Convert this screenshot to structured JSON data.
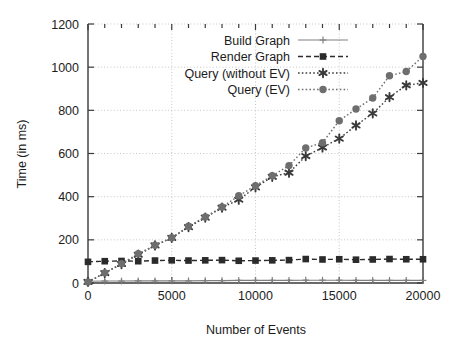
{
  "chart_data": {
    "type": "line",
    "title": "",
    "subtitle": "",
    "xlabel": "Number of Events",
    "ylabel": "Time (in ms)",
    "xlim": [
      0,
      20000
    ],
    "ylim": [
      0,
      1200
    ],
    "xticks": [
      0,
      5000,
      10000,
      15000,
      20000
    ],
    "xtick_labels": [
      "0",
      "5000",
      "10000",
      "15000",
      "20000"
    ],
    "yticks": [
      0,
      200,
      400,
      600,
      800,
      1000,
      1200
    ],
    "ytick_labels": [
      "0",
      "200",
      "400",
      "600",
      "800",
      "1000",
      "1200"
    ],
    "x_minor_tick_step": 1000,
    "grid": true,
    "grid_style": "dotted",
    "legend_position": "top-center",
    "legend_box": false,
    "x": [
      0,
      1000,
      2000,
      3000,
      4000,
      5000,
      6000,
      7000,
      8000,
      9000,
      10000,
      11000,
      12000,
      13000,
      14000,
      15000,
      16000,
      17000,
      18000,
      19000,
      20000
    ],
    "series": [
      {
        "name": "Build Graph",
        "marker": "plus",
        "line": "solid",
        "color": "#808080",
        "values": [
          8,
          9,
          9,
          10,
          10,
          10,
          10,
          11,
          11,
          12,
          12,
          12,
          12,
          13,
          13,
          13,
          12,
          12,
          12,
          12,
          12
        ]
      },
      {
        "name": "Render Graph",
        "marker": "filled-square",
        "line": "dashed",
        "color": "#2b2b2b",
        "values": [
          98,
          101,
          102,
          101,
          104,
          105,
          104,
          105,
          106,
          103,
          104,
          105,
          106,
          111,
          109,
          110,
          108,
          109,
          111,
          110,
          110
        ]
      },
      {
        "name": "Query (without EV)",
        "marker": "star",
        "line": "dotted",
        "color": "#3a3a3a",
        "values": [
          5,
          46,
          88,
          131,
          174,
          209,
          259,
          303,
          349,
          386,
          443,
          492,
          511,
          588,
          628,
          669,
          730,
          786,
          861,
          916,
          927
        ]
      },
      {
        "name": "Query (EV)",
        "marker": "filled-circle",
        "line": "dotted",
        "color": "#6e6e6e",
        "values": [
          5,
          47,
          90,
          136,
          175,
          210,
          263,
          306,
          352,
          404,
          451,
          497,
          544,
          626,
          650,
          752,
          806,
          857,
          960,
          980,
          1050
        ]
      }
    ]
  }
}
